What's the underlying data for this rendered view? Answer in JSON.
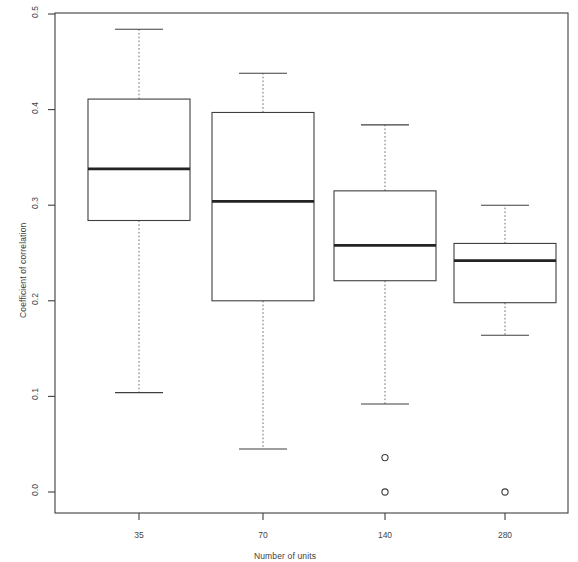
{
  "chart_data": {
    "type": "box",
    "title": "",
    "xlabel": "Number of units",
    "ylabel": "Coefficient of correlation",
    "categories": [
      "35",
      "70",
      "140",
      "280"
    ],
    "xtick_labels": [
      "35",
      "70",
      "140",
      "280"
    ],
    "ytick_labels": [
      "0.0",
      "0.1",
      "0.2",
      "0.3",
      "0.4",
      "0.5"
    ],
    "ytick_values": [
      0.0,
      0.1,
      0.2,
      0.3,
      0.4,
      0.5
    ],
    "ylim": [
      0.0,
      0.5
    ],
    "grid": false,
    "legend": "none",
    "frame": "box",
    "boxes": [
      {
        "category": "35",
        "whisker_low": 0.104,
        "q1": 0.284,
        "median": 0.338,
        "q3": 0.411,
        "whisker_high": 0.484,
        "outliers": []
      },
      {
        "category": "70",
        "whisker_low": 0.045,
        "q1": 0.2,
        "median": 0.304,
        "q3": 0.397,
        "whisker_high": 0.438,
        "outliers": []
      },
      {
        "category": "140",
        "whisker_low": 0.092,
        "q1": 0.221,
        "median": 0.258,
        "q3": 0.315,
        "whisker_high": 0.384,
        "outliers": [
          0.036,
          0.0
        ]
      },
      {
        "category": "280",
        "whisker_low": 0.164,
        "q1": 0.198,
        "median": 0.242,
        "q3": 0.26,
        "whisker_high": 0.3,
        "outliers": [
          0.0
        ]
      }
    ],
    "colors": {
      "line": "#3f3f3f",
      "median": "#232323",
      "whisker": "#6a6a6a",
      "background": "#ffffff",
      "text": "#404040"
    }
  },
  "layout": {
    "plot_left": 55,
    "plot_right": 568,
    "plot_top": 13,
    "plot_bottom": 513,
    "y_zero_px": 492,
    "y_max_px": 14,
    "box_centers_px": [
      139,
      263,
      385,
      505
    ],
    "box_half_width_px": 51,
    "cap_half_width_px": 24,
    "xtick_y_px": 513,
    "xtick_label_y_px": 530
  }
}
